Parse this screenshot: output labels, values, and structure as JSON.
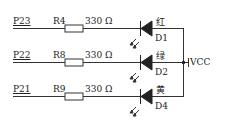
{
  "diagram": {
    "type": "LED circuit schematic",
    "supply_label": "VCC",
    "rows": [
      {
        "port": "P23",
        "resistor": "R4",
        "value": "330 Ω",
        "color_label": "红",
        "diode": "D1",
        "y": 28
      },
      {
        "port": "P22",
        "resistor": "R8",
        "value": "330 Ω",
        "color_label": "绿",
        "diode": "D2",
        "y": 62
      },
      {
        "port": "P21",
        "resistor": "R9",
        "value": "330 Ω",
        "color_label": "黄",
        "diode": "D4",
        "y": 96
      }
    ],
    "colors": {
      "line": "#333333",
      "background": "#ffffff"
    }
  }
}
